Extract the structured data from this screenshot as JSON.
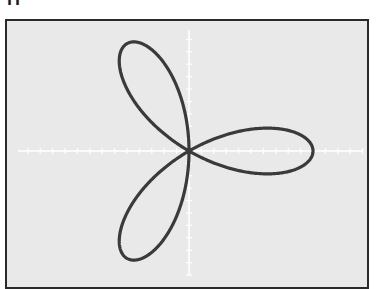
{
  "header": {
    "label_fragment": "rr"
  },
  "chart_data": {
    "type": "line",
    "subtype": "polar-rose",
    "title": "",
    "equation": "r = cos(3θ)",
    "petals": 3,
    "petal_directions_deg": [
      0,
      120,
      240
    ],
    "xlabel": "",
    "ylabel": "",
    "xlim": [
      -1.5,
      1.5
    ],
    "ylim": [
      -1.2,
      1.2
    ],
    "grid": false,
    "axes": "centered with white tick marks",
    "tick_labels": [],
    "legend": null,
    "colors": {
      "curve": "#3a3a3a",
      "background": "#e9e9e9",
      "axes": "#ffffff",
      "frame": "#2a2a2a"
    }
  }
}
